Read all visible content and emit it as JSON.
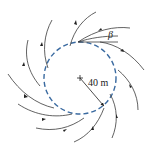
{
  "diagram": {
    "radius_label": "40 m",
    "angle_label": "β",
    "colors": {
      "circle": "#3a6aa0",
      "streamlines": "#3a3a3a",
      "background": "#ffffff"
    },
    "elements": [
      "dashed circle",
      "center cross mark",
      "radius arrow",
      "12 spiral streamlines with arrowheads",
      "angle β annotation with tangent line"
    ]
  }
}
